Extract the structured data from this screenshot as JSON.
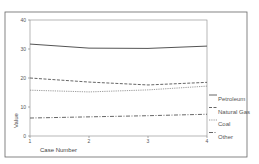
{
  "chart_data": {
    "type": "line",
    "title": "",
    "xlabel": "Case Number",
    "ylabel": "Value",
    "x": [
      1,
      2,
      3,
      4
    ],
    "x_ticks": [
      "1",
      "2",
      "3",
      "4"
    ],
    "y_ticks": [
      "0",
      "10",
      "20",
      "30",
      "40"
    ],
    "ylim": [
      0,
      40
    ],
    "xlim": [
      1,
      4
    ],
    "grid": false,
    "legend_position": "right",
    "series": [
      {
        "name": "Petroleum",
        "values": [
          31.7,
          30.3,
          30.2,
          31.0
        ],
        "style": "solid",
        "color": "#555555"
      },
      {
        "name": "Natural Gas",
        "values": [
          20.0,
          18.6,
          17.6,
          18.5
        ],
        "style": "dashed",
        "color": "#555555"
      },
      {
        "name": "Coal",
        "values": [
          15.8,
          15.2,
          15.9,
          17.2
        ],
        "style": "dotted",
        "color": "#777777"
      },
      {
        "name": "Other",
        "values": [
          6.2,
          6.6,
          7.0,
          7.5
        ],
        "style": "dashdot",
        "color": "#555555"
      }
    ]
  }
}
